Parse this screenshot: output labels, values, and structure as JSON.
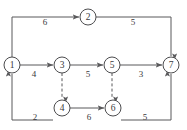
{
  "diagram": {
    "type": "directed-network-graph",
    "width": 187,
    "height": 130,
    "background_color": "#ffffff",
    "stroke_color": "#59595b",
    "node_stroke_color": "#4d4d4f",
    "text_color": "#3a3a3c",
    "nodes": [
      {
        "id": "1",
        "label": "1",
        "cx": 12,
        "cy": 65,
        "r": 8
      },
      {
        "id": "2",
        "label": "2",
        "cx": 88,
        "cy": 17,
        "r": 8
      },
      {
        "id": "3",
        "label": "3",
        "cx": 62,
        "cy": 65,
        "r": 8
      },
      {
        "id": "4",
        "label": "4",
        "cx": 62,
        "cy": 108,
        "r": 8
      },
      {
        "id": "5",
        "label": "5",
        "cx": 112,
        "cy": 65,
        "r": 8
      },
      {
        "id": "6",
        "label": "6",
        "cx": 113,
        "cy": 108,
        "r": 8
      },
      {
        "id": "7",
        "label": "7",
        "cx": 171,
        "cy": 65,
        "r": 8
      }
    ],
    "edges": [
      {
        "id": "e1-2",
        "from": "1",
        "to": "2",
        "label": "6",
        "style": "solid",
        "label_x": 45,
        "label_y": 23
      },
      {
        "id": "e2-7",
        "from": "2",
        "to": "7",
        "label": "5",
        "style": "solid",
        "label_x": 133,
        "label_y": 23
      },
      {
        "id": "e1-3",
        "from": "1",
        "to": "3",
        "label": "4",
        "style": "solid",
        "label_x": 34,
        "label_y": 75
      },
      {
        "id": "e3-5",
        "from": "3",
        "to": "5",
        "label": "5",
        "style": "solid",
        "label_x": 88,
        "label_y": 75
      },
      {
        "id": "e5-7",
        "from": "5",
        "to": "7",
        "label": "3",
        "style": "solid",
        "label_x": 141,
        "label_y": 75
      },
      {
        "id": "e1-4",
        "from": "1",
        "to": "4",
        "label": "2",
        "style": "solid",
        "label_x": 35,
        "label_y": 118
      },
      {
        "id": "e4-6",
        "from": "4",
        "to": "6",
        "label": "6",
        "style": "solid",
        "label_x": 89,
        "label_y": 118
      },
      {
        "id": "e6-7",
        "from": "6",
        "to": "7",
        "label": "5",
        "style": "solid",
        "label_x": 145,
        "label_y": 118
      },
      {
        "id": "e3-4",
        "from": "3",
        "to": "4",
        "label": "",
        "style": "dashed",
        "label_x": 0,
        "label_y": 0
      },
      {
        "id": "e5-6",
        "from": "5",
        "to": "6",
        "label": "",
        "style": "dashed",
        "label_x": 0,
        "label_y": 0
      }
    ]
  }
}
